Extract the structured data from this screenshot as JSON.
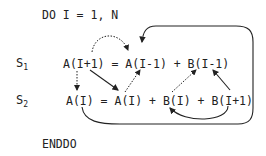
{
  "loop": {
    "header": "DO I = 1, N",
    "footer": "ENDDO"
  },
  "statements": [
    {
      "label": "S",
      "subscript": "1",
      "code": "A(I+1) = A(I-1) + B(I-1)"
    },
    {
      "label": "S",
      "subscript": "2",
      "code": "A(I) = A(I) + B(I) + B(I+1)"
    }
  ],
  "dependences": [
    {
      "from": "S1:A(I+1)",
      "to": "S1:A(I-1)",
      "style": "dotted",
      "shape": "arc"
    },
    {
      "from": "S1:A(I+1)",
      "to": "S2:A(I)",
      "style": "dotted",
      "shape": "line-down"
    },
    {
      "from": "S1:A(I+1)",
      "to": "S2:A(I) rhs",
      "style": "solid",
      "shape": "line"
    },
    {
      "from": "S2:A(I) rhs",
      "to": "S1:A(I-1)",
      "style": "dotted",
      "shape": "line"
    },
    {
      "from": "S2:B(I)",
      "to": "S1:B(I-1)",
      "style": "dotted",
      "shape": "line"
    },
    {
      "from": "S2:B(I+1)",
      "to": "S1:B(I-1)",
      "style": "solid",
      "shape": "line"
    },
    {
      "from": "S2:B(I+1)",
      "to": "S2:B(I)",
      "style": "solid",
      "shape": "arc"
    },
    {
      "from": "S2:A(I) lhs",
      "to": "S1:A(I-1)",
      "style": "solid",
      "shape": "loop-around"
    }
  ]
}
